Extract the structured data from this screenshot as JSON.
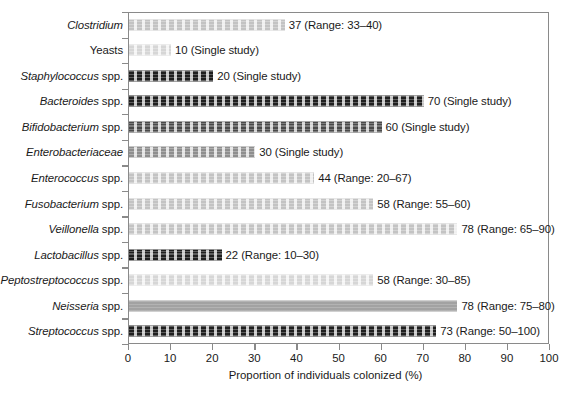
{
  "chart_data": {
    "type": "bar",
    "orientation": "horizontal",
    "title": "",
    "xlabel": "Proportion of individuals colonized (%)",
    "ylabel": "",
    "xlim": [
      0,
      100
    ],
    "xticks": [
      0,
      10,
      20,
      30,
      40,
      50,
      60,
      70,
      80,
      90,
      100
    ],
    "grid": false,
    "legend": false,
    "categories": [
      "Clostridium",
      "Yeasts",
      "Staphylococcus spp.",
      "Bacteroides spp.",
      "Bifidobacterium spp.",
      "Enterobacteriaceae",
      "Enterococcus spp.",
      "Fusobacterium spp.",
      "Veillonella spp.",
      "Lactobacillus spp.",
      "Peptostreptococcus spp.",
      "Neisseria spp.",
      "Streptococcus spp."
    ],
    "values": [
      37,
      10,
      20,
      70,
      60,
      30,
      44,
      58,
      78,
      22,
      58,
      78,
      73
    ],
    "annotations": [
      "37 (Range: 33–40)",
      "10 (Single study)",
      "20 (Single study)",
      "70 (Single study)",
      "60 (Single study)",
      "30 (Single study)",
      "44 (Range: 20–67)",
      "58 (Range: 55–60)",
      "78 (Range: 65–90)",
      "22 (Range: 10–30)",
      "58 (Range: 30–85)",
      "78 (Range: 75–80)",
      "73 (Range: 50–100)"
    ]
  },
  "rows": [
    {
      "genus": "Clostridium",
      "suffix": "",
      "italic": true,
      "value": 37,
      "annotation": "37 (Range: 33–40)",
      "tone": "tone-light"
    },
    {
      "genus": "Yeasts",
      "suffix": "",
      "italic": false,
      "value": 10,
      "annotation": "10 (Single study)",
      "tone": "tone-pale"
    },
    {
      "genus": "Staphylococcus",
      "suffix": " spp.",
      "italic": true,
      "value": 20,
      "annotation": "20 (Single study)",
      "tone": "tone-dark"
    },
    {
      "genus": "Bacteroides",
      "suffix": " spp.",
      "italic": true,
      "value": 70,
      "annotation": "70 (Single study)",
      "tone": "tone-dark"
    },
    {
      "genus": "Bifidobacterium",
      "suffix": " spp.",
      "italic": true,
      "value": 60,
      "annotation": "60 (Single study)",
      "tone": "tone-mid"
    },
    {
      "genus": "Enterobacteriaceae",
      "suffix": "",
      "italic": true,
      "value": 30,
      "annotation": "30 (Single study)",
      "tone": "tone-gray"
    },
    {
      "genus": "Enterococcus",
      "suffix": " spp.",
      "italic": true,
      "value": 44,
      "annotation": "44 (Range: 20–67)",
      "tone": "tone-light"
    },
    {
      "genus": "Fusobacterium",
      "suffix": " spp.",
      "italic": true,
      "value": 58,
      "annotation": "58 (Range: 55–60)",
      "tone": "tone-light"
    },
    {
      "genus": "Veillonella",
      "suffix": " spp.",
      "italic": true,
      "value": 78,
      "annotation": "78 (Range: 65–90)",
      "tone": "tone-light"
    },
    {
      "genus": "Lactobacillus",
      "suffix": " spp.",
      "italic": true,
      "value": 22,
      "annotation": "22 (Range: 10–30)",
      "tone": "tone-dark"
    },
    {
      "genus": "Peptostreptococcus",
      "suffix": " spp.",
      "italic": true,
      "value": 58,
      "annotation": "58 (Range: 30–85)",
      "tone": "tone-pale"
    },
    {
      "genus": "Neisseria",
      "suffix": " spp.",
      "italic": true,
      "value": 78,
      "annotation": "78 (Range: 75–80)",
      "tone": "tone-solid"
    },
    {
      "genus": "Streptococcus",
      "suffix": " spp.",
      "italic": true,
      "value": 73,
      "annotation": "73 (Range: 50–100)",
      "tone": "tone-dark"
    }
  ],
  "axis": {
    "xlabel": "Proportion of individuals colonized (%)",
    "ticks": [
      "0",
      "10",
      "20",
      "30",
      "40",
      "50",
      "60",
      "70",
      "80",
      "90",
      "100"
    ]
  },
  "colors": {
    "axis": "#8a8a8a",
    "text": "#1a1a1a",
    "background": "#ffffff"
  }
}
